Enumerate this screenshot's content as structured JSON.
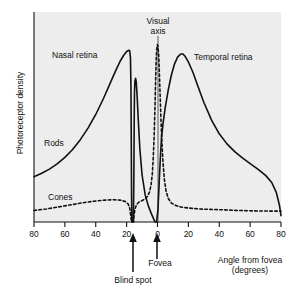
{
  "figure": {
    "background_color": "#ffffff",
    "plot_background_color": "#eeeeee",
    "line_color": "#111111"
  },
  "axes": {
    "y_title": "Photoreceptor density",
    "x_title_line1": "Angle from fovea",
    "x_title_line2": "(degrees)",
    "x_ticks": [
      "80",
      "60",
      "40",
      "20",
      "0",
      "20",
      "40",
      "60",
      "80"
    ],
    "x_tick_values": [
      -80,
      -60,
      -40,
      -20,
      0,
      20,
      40,
      60,
      80
    ],
    "y_ticks": []
  },
  "annotations": {
    "nasal_retina": "Nasal retina",
    "temporal_retina": "Temporal retina",
    "visual_axis": "Visual\naxis",
    "visual_axis_line1": "Visual",
    "visual_axis_line2": "axis",
    "rods": "Rods",
    "cones": "Cones",
    "fovea": "Fovea",
    "blind_spot": "Blind spot"
  },
  "chart_data": {
    "type": "line",
    "title": "",
    "xlabel": "Angle from fovea (degrees)",
    "ylabel": "Photoreceptor density",
    "xlim": [
      -80,
      80
    ],
    "ylim": [
      0,
      1
    ],
    "grid": false,
    "legend": "inline-labels",
    "x_tick_labels": [
      "80",
      "60",
      "40",
      "20",
      "0",
      "20",
      "40",
      "60",
      "80"
    ],
    "series": [
      {
        "name": "Rods",
        "style": "solid",
        "points": [
          [
            -80,
            0.215
          ],
          [
            -75,
            0.232
          ],
          [
            -70,
            0.252
          ],
          [
            -65,
            0.277
          ],
          [
            -60,
            0.308
          ],
          [
            -55,
            0.345
          ],
          [
            -50,
            0.392
          ],
          [
            -45,
            0.447
          ],
          [
            -40,
            0.512
          ],
          [
            -35,
            0.588
          ],
          [
            -30,
            0.672
          ],
          [
            -27,
            0.722
          ],
          [
            -24,
            0.768
          ],
          [
            -22,
            0.793
          ],
          [
            -20,
            0.812
          ],
          [
            -18.5,
            0.818
          ],
          [
            -18,
            0.815
          ],
          [
            -17.5,
            0.78
          ],
          [
            -17.2,
            0.64
          ],
          [
            -17.0,
            0.4
          ],
          [
            -16.8,
            0.12
          ],
          [
            -16.6,
            0.0
          ],
          [
            -15.6,
            0.0
          ],
          [
            -15.3,
            0.23
          ],
          [
            -15.1,
            0.48
          ],
          [
            -14.9,
            0.62
          ],
          [
            -14.6,
            0.672
          ],
          [
            -14.2,
            0.684
          ],
          [
            -13.8,
            0.67
          ],
          [
            -13.2,
            0.6
          ],
          [
            -12.4,
            0.48
          ],
          [
            -11.4,
            0.345
          ],
          [
            -10.0,
            0.225
          ],
          [
            -8.0,
            0.13
          ],
          [
            -6.0,
            0.078
          ],
          [
            -4.0,
            0.04
          ],
          [
            -2.5,
            0.015
          ],
          [
            -1.6,
            0.0
          ],
          [
            -0.6,
            0.0
          ],
          [
            0.3,
            0.06
          ],
          [
            1.0,
            0.17
          ],
          [
            1.8,
            0.3
          ],
          [
            2.6,
            0.402
          ],
          [
            3.6,
            0.47
          ],
          [
            5.0,
            0.545
          ],
          [
            7.0,
            0.63
          ],
          [
            9.0,
            0.7
          ],
          [
            11.0,
            0.752
          ],
          [
            13.0,
            0.785
          ],
          [
            15.0,
            0.8
          ],
          [
            16.5,
            0.8
          ],
          [
            18.0,
            0.788
          ],
          [
            20.0,
            0.762
          ],
          [
            23.0,
            0.712
          ],
          [
            26.0,
            0.65
          ],
          [
            30.0,
            0.57
          ],
          [
            35.0,
            0.485
          ],
          [
            40.0,
            0.42
          ],
          [
            45.0,
            0.372
          ],
          [
            50.0,
            0.335
          ],
          [
            55.0,
            0.305
          ],
          [
            60.0,
            0.278
          ],
          [
            65.0,
            0.252
          ],
          [
            70.0,
            0.222
          ],
          [
            74.0,
            0.188
          ],
          [
            77.0,
            0.14
          ],
          [
            79.0,
            0.08
          ],
          [
            80.0,
            0.03
          ]
        ]
      },
      {
        "name": "Cones",
        "style": "dashed",
        "points": [
          [
            -80,
            0.055
          ],
          [
            -72,
            0.062
          ],
          [
            -64,
            0.072
          ],
          [
            -56,
            0.082
          ],
          [
            -48,
            0.092
          ],
          [
            -40,
            0.1
          ],
          [
            -34,
            0.104
          ],
          [
            -28,
            0.106
          ],
          [
            -24,
            0.104
          ],
          [
            -21,
            0.098
          ],
          [
            -19,
            0.086
          ],
          [
            -18,
            0.066
          ],
          [
            -17.4,
            0.035
          ],
          [
            -16.9,
            0.005
          ],
          [
            -16.6,
            0.0
          ],
          [
            -15.6,
            0.0
          ],
          [
            -15.2,
            0.03
          ],
          [
            -14.6,
            0.062
          ],
          [
            -13.6,
            0.082
          ],
          [
            -12.0,
            0.095
          ],
          [
            -10.0,
            0.102
          ],
          [
            -8.0,
            0.11
          ],
          [
            -6.5,
            0.122
          ],
          [
            -5.2,
            0.142
          ],
          [
            -4.2,
            0.175
          ],
          [
            -3.4,
            0.225
          ],
          [
            -2.8,
            0.3
          ],
          [
            -2.2,
            0.405
          ],
          [
            -1.7,
            0.53
          ],
          [
            -1.3,
            0.65
          ],
          [
            -0.9,
            0.76
          ],
          [
            -0.5,
            0.825
          ],
          [
            -0.1,
            0.845
          ],
          [
            0.3,
            0.838
          ],
          [
            0.8,
            0.79
          ],
          [
            1.3,
            0.69
          ],
          [
            1.9,
            0.56
          ],
          [
            2.6,
            0.42
          ],
          [
            3.4,
            0.3
          ],
          [
            4.4,
            0.205
          ],
          [
            5.6,
            0.145
          ],
          [
            7.0,
            0.112
          ],
          [
            9.0,
            0.09
          ],
          [
            12.0,
            0.078
          ],
          [
            16.0,
            0.07
          ],
          [
            21.0,
            0.066
          ],
          [
            27.0,
            0.062
          ],
          [
            34.0,
            0.06
          ],
          [
            42.0,
            0.058
          ],
          [
            52.0,
            0.055
          ],
          [
            62.0,
            0.053
          ],
          [
            72.0,
            0.052
          ],
          [
            80.0,
            0.052
          ]
        ]
      }
    ],
    "markers": [
      {
        "name": "blind-spot-arrow",
        "x": -16.1,
        "label": "Blind spot"
      },
      {
        "name": "fovea-arrow",
        "x": 0,
        "label": "Fovea"
      },
      {
        "name": "visual-axis-line",
        "x": 0,
        "label": "Visual axis"
      }
    ]
  }
}
